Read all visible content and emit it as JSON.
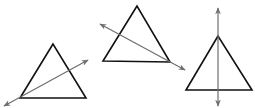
{
  "colors": {
    "background": "#ffffff",
    "triangle_stroke": "#111111",
    "line_stroke": "#6e6e6e"
  },
  "figures": [
    {
      "id": "triangle-1",
      "description": "Triangle with a line passing through its bottom-left vertex and crossing the right side",
      "vertices": [
        [
          53,
          44
        ],
        [
          20,
          98
        ],
        [
          86,
          98
        ]
      ],
      "line": {
        "from": [
          4,
          106
        ],
        "to": [
          88,
          60
        ],
        "arrows": "both"
      }
    },
    {
      "id": "triangle-2",
      "description": "Triangle with a line passing through its bottom-right vertex and crossing the left side",
      "vertices": [
        [
          137,
          6
        ],
        [
          103,
          61
        ],
        [
          170,
          62
        ]
      ],
      "line": {
        "from": [
          100,
          24
        ],
        "to": [
          185,
          70
        ],
        "arrows": "both"
      }
    },
    {
      "id": "triangle-3",
      "description": "Triangle with a vertical line through its apex (axis of symmetry)",
      "vertices": [
        [
          218,
          36
        ],
        [
          186,
          90
        ],
        [
          252,
          90
        ]
      ],
      "line": {
        "from": [
          218,
          8
        ],
        "to": [
          218,
          106
        ],
        "arrows": "both"
      }
    }
  ]
}
